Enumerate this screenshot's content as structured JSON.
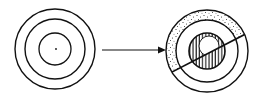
{
  "diagram": {
    "colors": {
      "ink": "#111111",
      "background": "#ffffff"
    },
    "left_figure": {
      "name": "concentric-circles",
      "center": [
        55,
        49
      ],
      "radii": [
        40,
        30,
        16
      ],
      "center_dot": true
    },
    "arrow": {
      "from": [
        102,
        50
      ],
      "to": [
        165,
        50
      ],
      "direction": "right"
    },
    "right_figure": {
      "name": "sectioned-disc",
      "center": [
        207,
        51
      ],
      "radii": [
        41,
        31,
        18,
        10
      ],
      "outer_ring_fill": "stipple (upper-left half only)",
      "inner_disc_fill": "vertical hatching",
      "cut_line": {
        "from": [
          169,
          70
        ],
        "to": [
          246,
          31
        ]
      }
    }
  }
}
